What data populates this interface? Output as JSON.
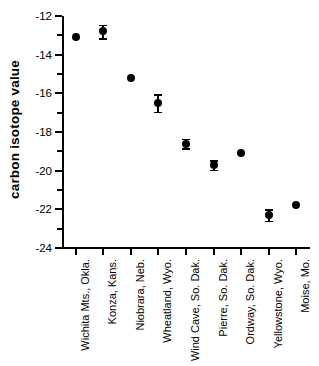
{
  "chart_data": {
    "type": "scatter",
    "title": "",
    "xlabel": "",
    "ylabel": "carbon isotope value",
    "ylim": [
      -24,
      -12
    ],
    "yticks": [
      -12,
      -14,
      -16,
      -18,
      -20,
      -22,
      -24
    ],
    "ytick_labels": [
      "-12",
      "-14",
      "-16",
      "-18",
      "-20",
      "-22",
      "-24"
    ],
    "yminor_ticks": [
      -13,
      -15,
      -17,
      -19,
      -21,
      -23
    ],
    "grid": false,
    "legend": null,
    "categories": [
      "Wichita Mts., Okla.",
      "Konza, Kans.",
      "Niobrara, Neb.",
      "Wheatland, Wyo.",
      "Wind Cave, So. Dak.",
      "Pierre, So. Dak.",
      "Ordway, So. Dak.",
      "Yellowstone, Wyo.",
      "Moise, Mo."
    ],
    "values": [
      -13.1,
      -12.8,
      -15.2,
      -16.5,
      -18.6,
      -19.7,
      -19.1,
      -22.3,
      -21.8
    ],
    "errors": [
      0.0,
      0.35,
      0.0,
      0.45,
      0.25,
      0.25,
      0.0,
      0.3,
      0.0
    ],
    "marker": "filled-circle",
    "marker_color": "#000000"
  }
}
